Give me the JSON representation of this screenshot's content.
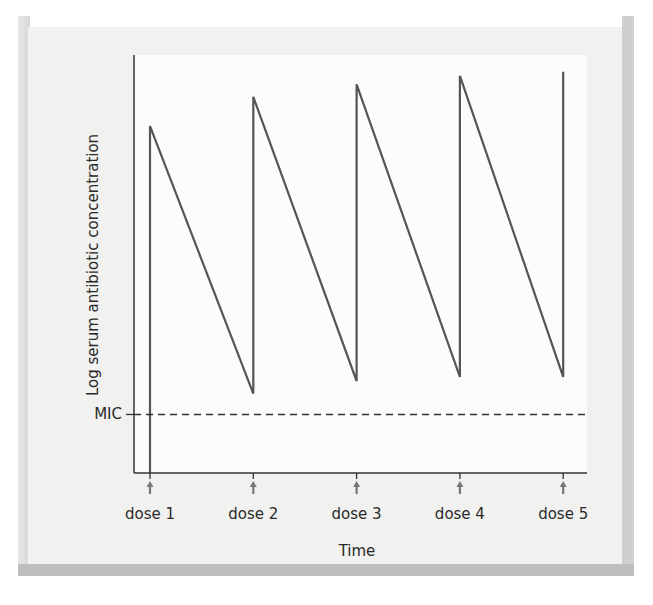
{
  "chart_data": {
    "type": "line",
    "title": "",
    "xlabel": "Time",
    "ylabel": "Log serum antibiotic concentration",
    "x_tick_labels": [
      "dose 1",
      "dose 2",
      "dose 3",
      "dose 4",
      "dose 5"
    ],
    "reference_line": {
      "label": "MIC",
      "value": 1.4,
      "style": "dashed"
    },
    "ylim": [
      0,
      10
    ],
    "xlim": [
      0,
      4.4
    ],
    "grid": false,
    "legend": null,
    "series": [
      {
        "name": "serum concentration",
        "points": [
          {
            "x": 0,
            "y": 0
          },
          {
            "x": 0,
            "y": 8.3
          },
          {
            "x": 1,
            "y": 1.9
          },
          {
            "x": 1,
            "y": 9.0
          },
          {
            "x": 2,
            "y": 2.2
          },
          {
            "x": 2,
            "y": 9.3
          },
          {
            "x": 3,
            "y": 2.3
          },
          {
            "x": 3,
            "y": 9.5
          },
          {
            "x": 4,
            "y": 2.3
          },
          {
            "x": 4,
            "y": 9.6
          }
        ]
      }
    ],
    "annotations": [
      "upward arrow below each dose marker on the time axis"
    ]
  },
  "colors": {
    "line": "#555555",
    "axis": "#333333",
    "arrow": "#777777",
    "frame": "#f1f1f0"
  }
}
